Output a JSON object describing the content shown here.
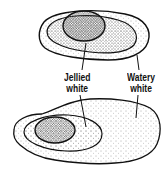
{
  "diagram": {
    "figures": [
      {
        "name": "fresh-egg",
        "position": "top",
        "description": "compact white, high yolk"
      },
      {
        "name": "older-egg",
        "position": "bottom",
        "description": "spread-out watery white, flat yolk"
      }
    ],
    "labels": {
      "jellied": {
        "line1": "Jellied",
        "line2": "white"
      },
      "watery": {
        "line1": "Watery",
        "line2": "white"
      }
    },
    "colors": {
      "ink": "#111111",
      "background": "#ffffff",
      "stipple": "#555555"
    }
  }
}
